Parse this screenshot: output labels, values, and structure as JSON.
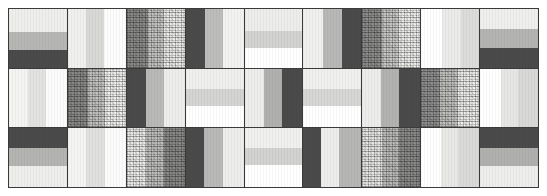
{
  "canvas": {
    "width": 547,
    "height": 196,
    "background": "#ffffff",
    "frame_color": "#3a3a3a",
    "gutter_color": "#3a3a3a"
  },
  "grid": {
    "columns": 9,
    "rows": 3,
    "total_patches": 27
  },
  "palette": {
    "near_white": "#ffffff",
    "white_warm": "#fafafa",
    "light_1": "#f0f0ef",
    "light_2": "#e8e8e6",
    "light_3": "#dcdcda",
    "mid_light": "#cacac8",
    "mid": "#b3b3b1",
    "mid_dark": "#9b9b99",
    "gray_dark": "#6e6e6c",
    "charcoal": "#4a4a4a",
    "near_black": "#3a3a3a"
  },
  "patches": [
    {
      "id": "r1c1",
      "row": 1,
      "col": 1,
      "kind": "horizontal-stripes",
      "bands": [
        {
          "color": "#eeeeec",
          "weight": 40
        },
        {
          "color": "#b6b6b4",
          "weight": 30
        },
        {
          "color": "#4a4a4a",
          "weight": 30
        }
      ]
    },
    {
      "id": "r1c2",
      "row": 1,
      "col": 2,
      "kind": "vertical-stripes",
      "bands": [
        {
          "color": "#f0f0ee",
          "weight": 32
        },
        {
          "color": "#d8d8d6",
          "weight": 30
        },
        {
          "color": "#fcfcfc",
          "weight": 38
        }
      ]
    },
    {
      "id": "r1c3",
      "row": 1,
      "col": 3,
      "kind": "noise-texture",
      "bands": [
        {
          "color": "#8c8c8a",
          "weight": 36
        },
        {
          "color": "#c6c6c4",
          "weight": 28
        },
        {
          "color": "#ededeb",
          "weight": 36
        }
      ]
    },
    {
      "id": "r1c4",
      "row": 1,
      "col": 4,
      "kind": "vertical-stripes",
      "bands": [
        {
          "color": "#4a4a4a",
          "weight": 34
        },
        {
          "color": "#bdbdbb",
          "weight": 30
        },
        {
          "color": "#f2f2f0",
          "weight": 36
        }
      ]
    },
    {
      "id": "r1c5",
      "row": 1,
      "col": 5,
      "kind": "horizontal-stripes",
      "bands": [
        {
          "color": "#ededeb",
          "weight": 38
        },
        {
          "color": "#d2d2d0",
          "weight": 28
        },
        {
          "color": "#ffffff",
          "weight": 34
        }
      ]
    },
    {
      "id": "r1c6",
      "row": 1,
      "col": 6,
      "kind": "vertical-stripes",
      "bands": [
        {
          "color": "#f0f0ee",
          "weight": 34
        },
        {
          "color": "#b8b8b6",
          "weight": 32
        },
        {
          "color": "#4a4a4a",
          "weight": 34
        }
      ]
    },
    {
      "id": "r1c7",
      "row": 1,
      "col": 7,
      "kind": "noise-texture",
      "bands": [
        {
          "color": "#8e8e8c",
          "weight": 34
        },
        {
          "color": "#c9c9c7",
          "weight": 30
        },
        {
          "color": "#efefed",
          "weight": 36
        }
      ]
    },
    {
      "id": "r1c8",
      "row": 1,
      "col": 8,
      "kind": "vertical-stripes",
      "bands": [
        {
          "color": "#ffffff",
          "weight": 36
        },
        {
          "color": "#ebebe9",
          "weight": 32
        },
        {
          "color": "#dcdcda",
          "weight": 32
        }
      ]
    },
    {
      "id": "r1c9",
      "row": 1,
      "col": 9,
      "kind": "horizontal-stripes",
      "bands": [
        {
          "color": "#efefed",
          "weight": 34
        },
        {
          "color": "#b4b4b2",
          "weight": 32
        },
        {
          "color": "#4a4a4a",
          "weight": 34
        }
      ]
    },
    {
      "id": "r2c1",
      "row": 2,
      "col": 1,
      "kind": "vertical-stripes",
      "bands": [
        {
          "color": "#f4f4f2",
          "weight": 32
        },
        {
          "color": "#e2e2e0",
          "weight": 32
        },
        {
          "color": "#fbfbfb",
          "weight": 36
        }
      ]
    },
    {
      "id": "r2c2",
      "row": 2,
      "col": 2,
      "kind": "noise-texture",
      "bands": [
        {
          "color": "#8a8a88",
          "weight": 34
        },
        {
          "color": "#c4c4c2",
          "weight": 30
        },
        {
          "color": "#f1f1ef",
          "weight": 36
        }
      ]
    },
    {
      "id": "r2c3",
      "row": 2,
      "col": 3,
      "kind": "vertical-stripes",
      "bands": [
        {
          "color": "#4a4a4a",
          "weight": 34
        },
        {
          "color": "#b9b9b7",
          "weight": 30
        },
        {
          "color": "#ededeb",
          "weight": 36
        }
      ]
    },
    {
      "id": "r2c4",
      "row": 2,
      "col": 4,
      "kind": "horizontal-stripes",
      "bands": [
        {
          "color": "#efefed",
          "weight": 34
        },
        {
          "color": "#d4d4d2",
          "weight": 30
        },
        {
          "color": "#ffffff",
          "weight": 36
        }
      ]
    },
    {
      "id": "r2c5",
      "row": 2,
      "col": 5,
      "kind": "vertical-stripes",
      "bands": [
        {
          "color": "#ededeb",
          "weight": 34
        },
        {
          "color": "#b0b0ae",
          "weight": 30
        },
        {
          "color": "#4a4a4a",
          "weight": 36
        }
      ]
    },
    {
      "id": "r2c6",
      "row": 2,
      "col": 6,
      "kind": "horizontal-stripes",
      "bands": [
        {
          "color": "#f0f0ee",
          "weight": 34
        },
        {
          "color": "#d6d6d4",
          "weight": 30
        },
        {
          "color": "#ffffff",
          "weight": 36
        }
      ]
    },
    {
      "id": "r2c7",
      "row": 2,
      "col": 7,
      "kind": "vertical-stripes",
      "bands": [
        {
          "color": "#ececea",
          "weight": 32
        },
        {
          "color": "#b2b2b0",
          "weight": 32
        },
        {
          "color": "#4a4a4a",
          "weight": 36
        }
      ]
    },
    {
      "id": "r2c8",
      "row": 2,
      "col": 8,
      "kind": "noise-texture",
      "bands": [
        {
          "color": "#909090",
          "weight": 32
        },
        {
          "color": "#c2c2c0",
          "weight": 32
        },
        {
          "color": "#efefed",
          "weight": 36
        }
      ]
    },
    {
      "id": "r2c9",
      "row": 2,
      "col": 9,
      "kind": "vertical-stripes",
      "bands": [
        {
          "color": "#ffffff",
          "weight": 36
        },
        {
          "color": "#e6e6e4",
          "weight": 30
        },
        {
          "color": "#d8d8d6",
          "weight": 34
        }
      ]
    },
    {
      "id": "r3c1",
      "row": 3,
      "col": 1,
      "kind": "horizontal-stripes",
      "bands": [
        {
          "color": "#4a4a4a",
          "weight": 34
        },
        {
          "color": "#b4b4b2",
          "weight": 30
        },
        {
          "color": "#eeeeec",
          "weight": 36
        }
      ]
    },
    {
      "id": "r3c2",
      "row": 3,
      "col": 2,
      "kind": "vertical-stripes",
      "bands": [
        {
          "color": "#f4f4f2",
          "weight": 32
        },
        {
          "color": "#e0e0de",
          "weight": 32
        },
        {
          "color": "#fbfbfb",
          "weight": 36
        }
      ]
    },
    {
      "id": "r3c3",
      "row": 3,
      "col": 3,
      "kind": "noise-texture",
      "bands": [
        {
          "color": "#eeeeec",
          "weight": 34
        },
        {
          "color": "#c0c0be",
          "weight": 30
        },
        {
          "color": "#8a8a88",
          "weight": 36
        }
      ]
    },
    {
      "id": "r3c4",
      "row": 3,
      "col": 4,
      "kind": "vertical-stripes",
      "bands": [
        {
          "color": "#4a4a4a",
          "weight": 32
        },
        {
          "color": "#b9b9b7",
          "weight": 32
        },
        {
          "color": "#ededeb",
          "weight": 36
        }
      ]
    },
    {
      "id": "r3c5",
      "row": 3,
      "col": 5,
      "kind": "horizontal-stripes",
      "bands": [
        {
          "color": "#f0f0ee",
          "weight": 34
        },
        {
          "color": "#d2d2d0",
          "weight": 28
        },
        {
          "color": "#ffffff",
          "weight": 38
        }
      ]
    },
    {
      "id": "r3c6",
      "row": 3,
      "col": 6,
      "kind": "vertical-stripes",
      "bands": [
        {
          "color": "#4a4a4a",
          "weight": 30
        },
        {
          "color": "#ededeb",
          "weight": 32
        },
        {
          "color": "#b6b6b4",
          "weight": 38
        }
      ]
    },
    {
      "id": "r3c7",
      "row": 3,
      "col": 7,
      "kind": "noise-texture",
      "bands": [
        {
          "color": "#e8e8e6",
          "weight": 34
        },
        {
          "color": "#bdbdbb",
          "weight": 30
        },
        {
          "color": "#8c8c8a",
          "weight": 36
        }
      ]
    },
    {
      "id": "r3c8",
      "row": 3,
      "col": 8,
      "kind": "vertical-stripes",
      "bands": [
        {
          "color": "#ffffff",
          "weight": 34
        },
        {
          "color": "#e8e8e6",
          "weight": 30
        },
        {
          "color": "#dadad8",
          "weight": 36
        }
      ]
    },
    {
      "id": "r3c9",
      "row": 3,
      "col": 9,
      "kind": "horizontal-stripes",
      "bands": [
        {
          "color": "#4a4a4a",
          "weight": 34
        },
        {
          "color": "#b0b0ae",
          "weight": 30
        },
        {
          "color": "#eeeeec",
          "weight": 36
        }
      ]
    }
  ]
}
